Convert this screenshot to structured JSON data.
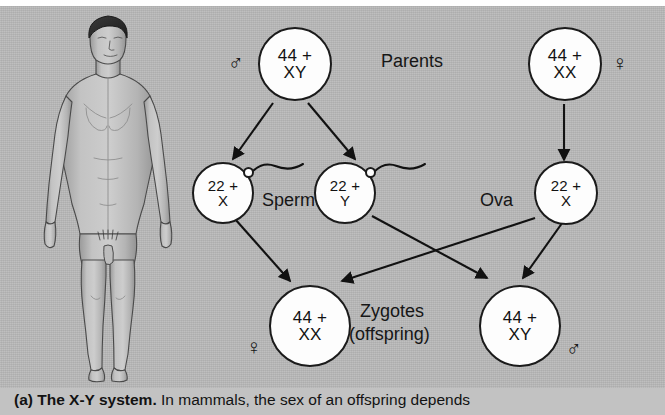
{
  "figure": {
    "label": "X-Y sex determination diagram",
    "background_color": "#b9b9b9",
    "ink_color": "#1b1b1b",
    "cell_fill": "#fdfdfd"
  },
  "illustration": {
    "name": "human-male-figure",
    "description": "Anatomical drawing of a standing nude male human body, front view, head to feet"
  },
  "labels": {
    "parents": "Parents",
    "sperm": "Sperm",
    "ova": "Ova",
    "zygotes_line1": "Zygotes",
    "zygotes_line2": "(offspring)"
  },
  "symbols": {
    "male": "♂",
    "female": "♀"
  },
  "cells": {
    "father": {
      "line1": "44 +",
      "line2": "XY",
      "sex": "♂"
    },
    "mother": {
      "line1": "44 +",
      "line2": "XX",
      "sex": "♀"
    },
    "sperm_x": {
      "line1": "22 +",
      "line2": "X"
    },
    "sperm_y": {
      "line1": "22 +",
      "line2": "Y"
    },
    "ovum_x": {
      "line1": "22 +",
      "line2": "X"
    },
    "zygote_female": {
      "line1": "44 +",
      "line2": "XX",
      "sex": "♀"
    },
    "zygote_male": {
      "line1": "44 +",
      "line2": "XY",
      "sex": "♂"
    }
  },
  "caption": {
    "bold": "(a) The X-Y system.",
    "rest": " In mammals, the sex of an offspring depends"
  }
}
